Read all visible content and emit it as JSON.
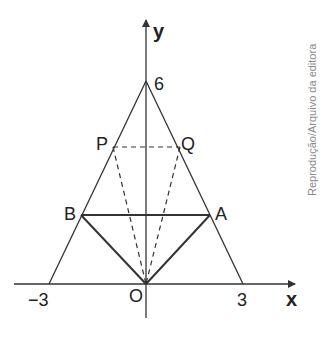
{
  "diagram": {
    "type": "geometry-coordinate-plane",
    "axes": {
      "x_label": "x",
      "y_label": "y",
      "origin_label": "O",
      "x_ticks": [
        "-3",
        "3"
      ],
      "x_tick_display": [
        "−3",
        "3"
      ],
      "y_ticks": [
        "6"
      ]
    },
    "points": {
      "apex": {
        "label": "6",
        "coords": [
          0,
          6
        ]
      },
      "left_base": {
        "label": "−3",
        "coords": [
          -3,
          0
        ]
      },
      "right_base": {
        "label": "3",
        "coords": [
          3,
          0
        ]
      },
      "A": {
        "label": "A",
        "coords": [
          2,
          2
        ]
      },
      "B": {
        "label": "B",
        "coords": [
          -2,
          2
        ]
      },
      "P": {
        "label": "P",
        "coords": [
          -1,
          4
        ]
      },
      "Q": {
        "label": "Q",
        "coords": [
          1,
          4
        ]
      },
      "O": {
        "label": "O",
        "coords": [
          0,
          0
        ]
      }
    },
    "segments": {
      "solid": [
        "apex-left_base",
        "apex-right_base",
        "B-A",
        "B-O",
        "A-O"
      ],
      "dashed": [
        "P-Q",
        "P-O",
        "Q-O"
      ]
    },
    "credit": "Reprodução/Arquivo da editora"
  }
}
